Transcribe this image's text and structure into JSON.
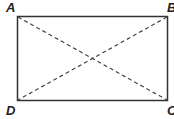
{
  "diagram": {
    "type": "rectangle-with-diagonals",
    "vertices": [
      {
        "label": "A",
        "x": 17,
        "y": 16
      },
      {
        "label": "B",
        "x": 168,
        "y": 16
      },
      {
        "label": "C",
        "x": 168,
        "y": 101
      },
      {
        "label": "D",
        "x": 17,
        "y": 101
      }
    ],
    "diagonals": [
      {
        "from": "A",
        "to": "C",
        "style": "dashed"
      },
      {
        "from": "B",
        "to": "D",
        "style": "dashed"
      }
    ],
    "colors": {
      "stroke": "#333333",
      "background": "#ffffff"
    }
  }
}
